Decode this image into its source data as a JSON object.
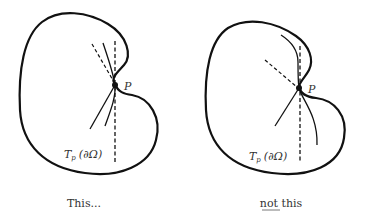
{
  "figure": {
    "type": "diagram",
    "panels": [
      {
        "id": "left",
        "caption": "This...",
        "point_label": "P",
        "tangent_label": {
          "main": "T",
          "sub": "p",
          "arg": "(∂Ω)"
        }
      },
      {
        "id": "right",
        "caption_underlined": "not",
        "caption_rest": " this",
        "point_label": "P",
        "tangent_label": {
          "main": "T",
          "sub": "p",
          "arg": "(∂Ω)"
        }
      }
    ],
    "colors": {
      "stroke": "#111111",
      "text": "#333333",
      "background": "#ffffff"
    }
  }
}
